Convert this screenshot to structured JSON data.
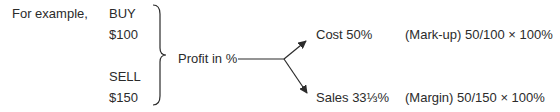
{
  "intro": "For example,",
  "buy": {
    "label": "BUY",
    "value": "$100"
  },
  "sell": {
    "label": "SELL",
    "value": "$150"
  },
  "center": "Profit in %",
  "branches": [
    {
      "result": "Cost 50%",
      "formula": "(Mark-up) 50/100 × 100%"
    },
    {
      "result": "Sales 33⅓%",
      "formula": "(Margin) 50/150 × 100%"
    }
  ]
}
